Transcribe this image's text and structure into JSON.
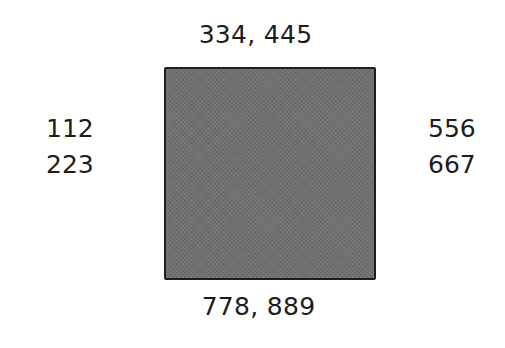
{
  "diagram": {
    "box": {
      "fill_color": "#6e6e6e",
      "border_color": "#1e1e1e"
    },
    "labels": {
      "top": "334, 445",
      "bottom": "778, 889",
      "left": [
        "112",
        "223"
      ],
      "right": [
        "556",
        "667"
      ]
    }
  }
}
